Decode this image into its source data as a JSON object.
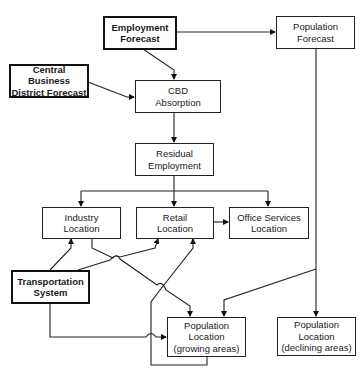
{
  "diagram": {
    "type": "flowchart",
    "nodes": [
      {
        "id": "employment-forecast",
        "lines": [
          "Employment",
          "Forecast"
        ],
        "emphasis": true
      },
      {
        "id": "population-forecast",
        "lines": [
          "Population",
          "Forecast"
        ],
        "emphasis": false
      },
      {
        "id": "cbd-forecast",
        "lines": [
          "Central Business",
          "District Forecast"
        ],
        "emphasis": true
      },
      {
        "id": "cbd-absorption",
        "lines": [
          "CBD",
          "Absorption"
        ],
        "emphasis": false
      },
      {
        "id": "residual-employment",
        "lines": [
          "Residual",
          "Employment"
        ],
        "emphasis": false
      },
      {
        "id": "industry-location",
        "lines": [
          "Industry",
          "Location"
        ],
        "emphasis": false
      },
      {
        "id": "retail-location",
        "lines": [
          "Retail",
          "Location"
        ],
        "emphasis": false
      },
      {
        "id": "office-services-location",
        "lines": [
          "Office Services",
          "Location"
        ],
        "emphasis": false
      },
      {
        "id": "transportation-system",
        "lines": [
          "Transportation",
          "System"
        ],
        "emphasis": true
      },
      {
        "id": "population-location-growing",
        "lines": [
          "Population",
          "Location",
          "(growing areas)"
        ],
        "emphasis": false
      },
      {
        "id": "population-location-declining",
        "lines": [
          "Population",
          "Location",
          "(declining areas)"
        ],
        "emphasis": false
      }
    ],
    "edges": [
      {
        "from": "employment-forecast",
        "to": "population-forecast"
      },
      {
        "from": "employment-forecast",
        "to": "cbd-absorption"
      },
      {
        "from": "cbd-forecast",
        "to": "cbd-absorption"
      },
      {
        "from": "cbd-absorption",
        "to": "residual-employment"
      },
      {
        "from": "residual-employment",
        "to": "industry-location"
      },
      {
        "from": "residual-employment",
        "to": "retail-location"
      },
      {
        "from": "residual-employment",
        "to": "office-services-location"
      },
      {
        "from": "retail-location",
        "to": "office-services-location"
      },
      {
        "from": "transportation-system",
        "to": "industry-location"
      },
      {
        "from": "transportation-system",
        "to": "retail-location"
      },
      {
        "from": "transportation-system",
        "to": "population-location-growing"
      },
      {
        "from": "industry-location",
        "to": "population-location-growing"
      },
      {
        "from": "population-location-growing",
        "to": "retail-location"
      },
      {
        "from": "population-forecast",
        "to": "population-location-growing"
      },
      {
        "from": "population-forecast",
        "to": "population-location-declining"
      }
    ]
  }
}
